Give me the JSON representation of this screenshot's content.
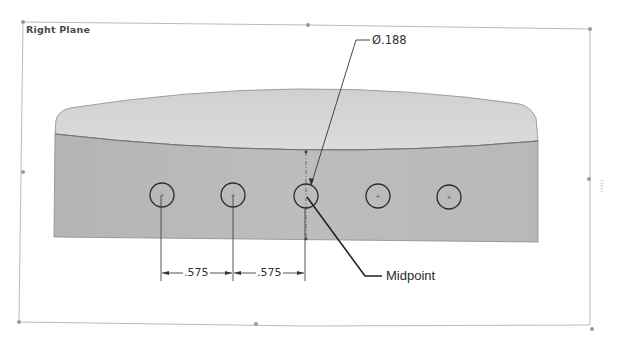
{
  "view": {
    "plane_label": "Right Plane"
  },
  "annotations": {
    "hole_diameter": "Ø.188",
    "spacing_1": ".575",
    "spacing_2": ".575",
    "callout": "Midpoint"
  },
  "holes": [
    {
      "cx": 162,
      "cy": 195,
      "r": 12
    },
    {
      "cx": 233,
      "cy": 195,
      "r": 12
    },
    {
      "cx": 306,
      "cy": 196,
      "r": 12
    },
    {
      "cx": 378,
      "cy": 196,
      "r": 12
    },
    {
      "cx": 449,
      "cy": 197,
      "r": 12
    }
  ],
  "colors": {
    "frame": "#b8b8b8",
    "body_top": "#d6d6d6",
    "body_front": "#b9b9b9",
    "edge": "#7a7a7a",
    "line": "#333333"
  }
}
